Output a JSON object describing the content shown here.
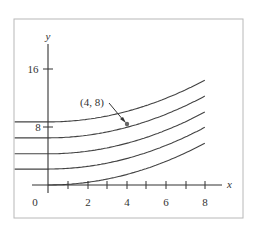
{
  "chart_data": {
    "type": "line",
    "title": "",
    "xlabel": "x",
    "ylabel": "y",
    "xlim": [
      -1.7,
      9
    ],
    "ylim": [
      -1,
      19
    ],
    "x_ticks": [
      1,
      2,
      3,
      4,
      5,
      6,
      7,
      8
    ],
    "x_tick_labels": [
      "0",
      "2",
      "4",
      "6",
      "8"
    ],
    "y_ticks": [
      8,
      16
    ],
    "y_tick_labels": [
      "8",
      "16"
    ],
    "grid": false,
    "legend": null,
    "series": [
      {
        "name": "curve C=0",
        "x": [
          0,
          2,
          4,
          6,
          8
        ],
        "values": [
          0,
          0.36,
          1.44,
          3.24,
          5.76
        ]
      },
      {
        "name": "curve C=2.2",
        "x": [
          0,
          2,
          4,
          6,
          8
        ],
        "values": [
          2.2,
          2.56,
          3.64,
          5.44,
          7.96
        ]
      },
      {
        "name": "curve C=4.3",
        "x": [
          0,
          2,
          4,
          6,
          8
        ],
        "values": [
          4.3,
          4.66,
          5.74,
          7.54,
          10.06
        ]
      },
      {
        "name": "curve C=6.5",
        "x": [
          0,
          2,
          4,
          6,
          8
        ],
        "values": [
          6.5,
          6.86,
          7.94,
          9.74,
          12.26
        ]
      },
      {
        "name": "curve C=8.7",
        "x": [
          0,
          2,
          4,
          6,
          8
        ],
        "values": [
          8.7,
          9.06,
          10.14,
          11.94,
          14.46
        ]
      }
    ],
    "annotations": [
      {
        "text": "(4, 8)",
        "point": [
          4,
          8
        ],
        "arrow": true
      }
    ]
  },
  "labels": {
    "x_axis": "x",
    "y_axis": "y",
    "origin": "0",
    "x2": "2",
    "x4": "4",
    "x6": "6",
    "x8": "8",
    "y8": "8",
    "y16": "16",
    "point": "(4, 8)"
  },
  "colors": {
    "frame": "#b8b8b8",
    "axes": "#333333",
    "curves": "#444444"
  }
}
